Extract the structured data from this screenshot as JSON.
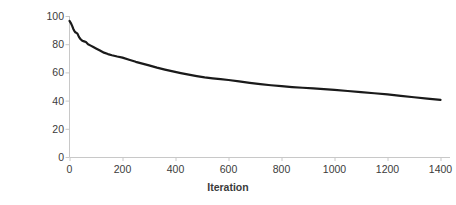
{
  "chart_data": {
    "type": "line",
    "title": "",
    "xlabel": "Iteration",
    "ylabel": "Deviation from 8.5 hours (min)",
    "ylabel_lines": [
      "Deviation from 8.5 hours",
      "(min)"
    ],
    "xlim": [
      0,
      1400
    ],
    "ylim": [
      0,
      100
    ],
    "xticks": [
      0,
      200,
      400,
      600,
      800,
      1000,
      1200,
      1400
    ],
    "yticks": [
      0,
      20,
      40,
      60,
      80,
      100
    ],
    "grid": false,
    "legend": false,
    "series": [
      {
        "name": "Deviation from 8.5 hours",
        "color": "#1a1a1a",
        "line_width": 2.2,
        "x": [
          0,
          5,
          10,
          14,
          18,
          22,
          26,
          30,
          36,
          42,
          48,
          55,
          62,
          70,
          80,
          90,
          100,
          115,
          130,
          145,
          160,
          180,
          200,
          225,
          250,
          275,
          300,
          330,
          360,
          390,
          420,
          450,
          480,
          510,
          540,
          570,
          600,
          640,
          680,
          720,
          760,
          800,
          840,
          880,
          920,
          960,
          1000,
          1050,
          1100,
          1150,
          1200,
          1250,
          1300,
          1350,
          1400
        ],
        "y": [
          96.5,
          95.0,
          93.0,
          91.0,
          89.5,
          88.5,
          88.0,
          87.5,
          85.0,
          83.5,
          82.5,
          82.0,
          81.5,
          80.0,
          79.0,
          78.0,
          77.0,
          75.5,
          74.0,
          73.0,
          72.2,
          71.3,
          70.5,
          69.0,
          67.5,
          66.2,
          65.0,
          63.4,
          62.0,
          60.7,
          59.5,
          58.4,
          57.4,
          56.5,
          55.8,
          55.2,
          54.6,
          53.6,
          52.6,
          51.7,
          50.9,
          50.2,
          49.6,
          49.1,
          48.6,
          48.1,
          47.6,
          46.8,
          46.0,
          45.2,
          44.4,
          43.4,
          42.4,
          41.4,
          40.5
        ]
      }
    ]
  },
  "axis": {
    "x_title": "Iteration",
    "y_title_line1": "Deviation from 8.5 hours",
    "y_title_line2": "(min)"
  }
}
